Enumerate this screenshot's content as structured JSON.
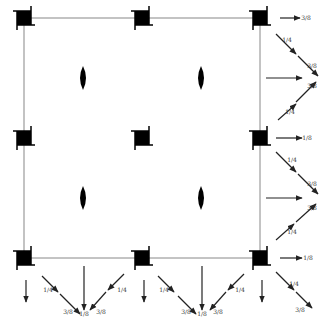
{
  "diagram": {
    "type": "space-group-symmetry-diagram",
    "cell": {
      "x0": 24,
      "y0": 18,
      "x1": 260,
      "y1": 258
    },
    "colors": {
      "line": "#888888",
      "symbol": "#000000",
      "arrow": "#222222",
      "label": "#333333"
    },
    "fourfold_axes": [
      {
        "x": 24,
        "y": 18
      },
      {
        "x": 142,
        "y": 18
      },
      {
        "x": 260,
        "y": 18
      },
      {
        "x": 24,
        "y": 138
      },
      {
        "x": 142,
        "y": 138
      },
      {
        "x": 260,
        "y": 138
      },
      {
        "x": 24,
        "y": 258
      },
      {
        "x": 142,
        "y": 258
      },
      {
        "x": 260,
        "y": 258
      }
    ],
    "twofold_axes": [
      {
        "x": 83,
        "y": 78
      },
      {
        "x": 201,
        "y": 78
      },
      {
        "x": 83,
        "y": 198
      },
      {
        "x": 201,
        "y": 198
      }
    ],
    "right_arrows": [
      {
        "x1": 280,
        "y1": 18,
        "x2": 300,
        "y2": 18,
        "label": "3/8",
        "lx": 306,
        "ly": 20
      },
      {
        "x1": 276,
        "y1": 34,
        "x2": 296,
        "y2": 54,
        "label": "1/4",
        "lx": 287,
        "ly": 42
      },
      {
        "x1": 298,
        "y1": 56,
        "x2": 318,
        "y2": 76,
        "label": "3/8",
        "lx": 312,
        "ly": 68
      },
      {
        "x1": 266,
        "y1": 78,
        "x2": 302,
        "y2": 78,
        "label": "",
        "lx": 0,
        "ly": 0
      },
      {
        "x1": 296,
        "y1": 102,
        "x2": 316,
        "y2": 82,
        "label": "3/8",
        "lx": 312,
        "ly": 88
      },
      {
        "x1": 278,
        "y1": 120,
        "x2": 296,
        "y2": 104,
        "label": "1/4",
        "lx": 290,
        "ly": 114
      },
      {
        "x1": 276,
        "y1": 138,
        "x2": 302,
        "y2": 138,
        "label": "1/8",
        "lx": 307,
        "ly": 140
      },
      {
        "x1": 276,
        "y1": 152,
        "x2": 296,
        "y2": 172,
        "label": "1/4",
        "lx": 292,
        "ly": 162
      },
      {
        "x1": 298,
        "y1": 174,
        "x2": 318,
        "y2": 194,
        "label": "3/8",
        "lx": 312,
        "ly": 186
      },
      {
        "x1": 266,
        "y1": 198,
        "x2": 302,
        "y2": 198,
        "label": "",
        "lx": 0,
        "ly": 0
      },
      {
        "x1": 296,
        "y1": 222,
        "x2": 316,
        "y2": 204,
        "label": "3/8",
        "lx": 312,
        "ly": 210
      },
      {
        "x1": 276,
        "y1": 240,
        "x2": 294,
        "y2": 224,
        "label": "1/4",
        "lx": 292,
        "ly": 234
      },
      {
        "x1": 280,
        "y1": 258,
        "x2": 302,
        "y2": 258,
        "label": "1/8",
        "lx": 308,
        "ly": 260
      },
      {
        "x1": 276,
        "y1": 272,
        "x2": 294,
        "y2": 290,
        "label": "1/4",
        "lx": 294,
        "ly": 286
      },
      {
        "x1": 296,
        "y1": 292,
        "x2": 312,
        "y2": 308,
        "label": "3/8",
        "lx": 300,
        "ly": 312
      }
    ],
    "bottom_arrows": [
      {
        "x1": 26,
        "y1": 280,
        "x2": 26,
        "y2": 302,
        "label": "",
        "lx": 0,
        "ly": 0
      },
      {
        "x1": 42,
        "y1": 276,
        "x2": 58,
        "y2": 292,
        "label": "1/4",
        "lx": 48,
        "ly": 292
      },
      {
        "x1": 60,
        "y1": 294,
        "x2": 80,
        "y2": 314,
        "label": "3/8",
        "lx": 68,
        "ly": 314
      },
      {
        "x1": 84,
        "y1": 266,
        "x2": 84,
        "y2": 310,
        "label": "1/8",
        "lx": 84,
        "ly": 316
      },
      {
        "x1": 124,
        "y1": 274,
        "x2": 108,
        "y2": 290,
        "label": "1/4",
        "lx": 122,
        "ly": 292
      },
      {
        "x1": 106,
        "y1": 292,
        "x2": 90,
        "y2": 310,
        "label": "3/8",
        "lx": 101,
        "ly": 314
      },
      {
        "x1": 144,
        "y1": 280,
        "x2": 144,
        "y2": 302,
        "label": "",
        "lx": 0,
        "ly": 0
      },
      {
        "x1": 158,
        "y1": 276,
        "x2": 174,
        "y2": 292,
        "label": "1/4",
        "lx": 164,
        "ly": 292
      },
      {
        "x1": 178,
        "y1": 296,
        "x2": 196,
        "y2": 314,
        "label": "3/8",
        "lx": 186,
        "ly": 314
      },
      {
        "x1": 202,
        "y1": 266,
        "x2": 202,
        "y2": 310,
        "label": "1/8",
        "lx": 202,
        "ly": 316
      },
      {
        "x1": 244,
        "y1": 274,
        "x2": 228,
        "y2": 290,
        "label": "1/4",
        "lx": 240,
        "ly": 292
      },
      {
        "x1": 226,
        "y1": 292,
        "x2": 210,
        "y2": 310,
        "label": "3/8",
        "lx": 218,
        "ly": 314
      },
      {
        "x1": 262,
        "y1": 280,
        "x2": 262,
        "y2": 302,
        "label": "",
        "lx": 0,
        "ly": 0
      }
    ]
  }
}
